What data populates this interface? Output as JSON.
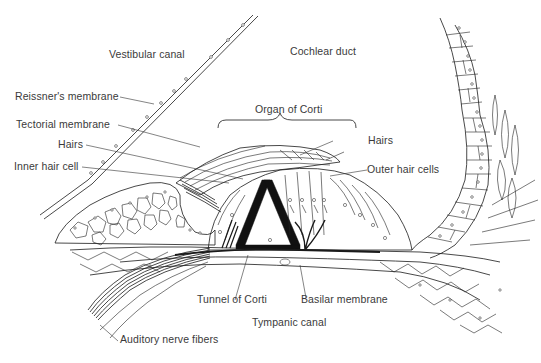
{
  "figure": {
    "type": "anatomical-diagram"
  },
  "labels": {
    "vestibular_canal": "Vestibular canal",
    "cochlear_duct": "Cochlear duct",
    "reissners_membrane": "Reissner's membrane",
    "organ_of_corti": "Organ of Corti",
    "tectorial_membrane": "Tectorial membrane",
    "hairs_left": "Hairs",
    "hairs_right": "Hairs",
    "inner_hair_cell": "Inner hair cell",
    "outer_hair_cells": "Outer hair cells",
    "tunnel_of_corti": "Tunnel of Corti",
    "basilar_membrane": "Basilar membrane",
    "tympanic_canal": "Tympanic canal",
    "auditory_nerve_fibers": "Auditory nerve fibers"
  },
  "colors": {
    "background": "#ffffff",
    "ink": "#1a1a1a",
    "label_text": "#3a3a3a"
  }
}
